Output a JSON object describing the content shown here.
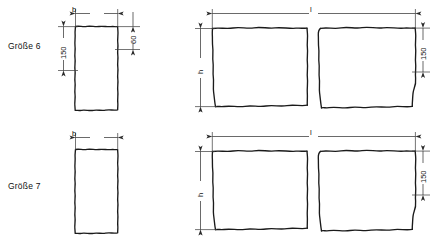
{
  "document": {
    "kind": "technical-drawing",
    "language": "de",
    "background_color": "#ffffff",
    "line_color": "#1a1a1a",
    "dim_line_color": "#3a3a3a"
  },
  "rows": [
    {
      "id": "groesse-6",
      "label": "Größe 6",
      "left_view": {
        "width_dim_label": "b",
        "height_dim_label": "150",
        "right_dim_label": "60"
      },
      "right_view": {
        "length_dim_label": "l",
        "height_dim_label": "h",
        "right_dim_label": "150"
      }
    },
    {
      "id": "groesse-7",
      "label": "Größe 7",
      "left_view": {
        "width_dim_label": "b",
        "height_dim_label": "",
        "right_dim_label": ""
      },
      "right_view": {
        "length_dim_label": "l",
        "height_dim_label": "h",
        "right_dim_label": "150"
      }
    }
  ],
  "footnote": {
    "text": ""
  }
}
